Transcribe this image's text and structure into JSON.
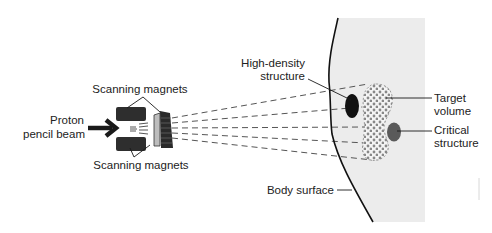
{
  "diagram": {
    "title": "Proton pencil beam scanning",
    "colors": {
      "body_fill": "#ececec",
      "ink": "#1a1a1a",
      "magnet": "#2e2e2e",
      "high_density": "#111111",
      "critical": "#5a5a5a",
      "target_dots": "#888888",
      "dash": "#555555"
    },
    "labels": {
      "proton_line1": "Proton",
      "proton_line2": "pencil beam",
      "magnets_top": "Scanning magnets",
      "magnets_bottom": "Scanning magnets",
      "high_density_line1": "High-density",
      "high_density_line2": "structure",
      "target_line1": "Target",
      "target_line2": "volume",
      "critical_line1": "Critical",
      "critical_line2": "structure",
      "body_surface": "Body surface"
    },
    "components": [
      {
        "name": "proton-pencil-beam-arrow",
        "icon": "arrow-right-icon"
      },
      {
        "name": "scanning-magnet-top"
      },
      {
        "name": "scanning-magnet-bottom"
      },
      {
        "name": "scanning-magnet-deflector"
      },
      {
        "name": "scanned-beam-paths",
        "count": 5
      },
      {
        "name": "body-region"
      },
      {
        "name": "body-surface-curve"
      },
      {
        "name": "high-density-structure"
      },
      {
        "name": "target-volume"
      },
      {
        "name": "critical-structure"
      }
    ]
  }
}
